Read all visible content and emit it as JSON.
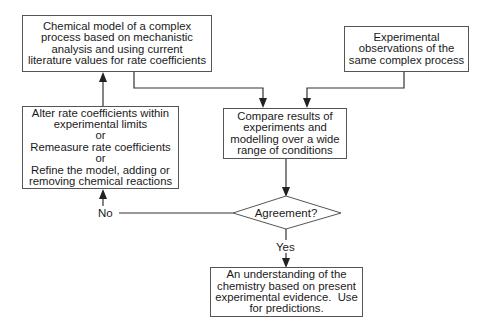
{
  "diagram": {
    "type": "flowchart",
    "nodes": {
      "model": {
        "lines": [
          "Chemical model of a complex",
          "process based on mechanistic",
          "analysis and using current",
          "literature values for rate coefficients"
        ]
      },
      "experiments": {
        "lines": [
          "Experimental",
          "observations of the",
          "same complex process"
        ]
      },
      "compare": {
        "lines": [
          "Compare results of",
          "experiments and",
          "modelling over a wide",
          "range of conditions"
        ]
      },
      "alter": {
        "lines": [
          "Alter rate coefficients within",
          "experimental limits",
          "or",
          "Remeasure rate coefficients",
          "or",
          "Refine the model, adding or",
          "removing chemical reactions"
        ]
      },
      "decision": {
        "label": "Agreement?"
      },
      "understanding": {
        "lines": [
          "An understanding of the",
          "chemistry based on present",
          "experimental evidence.  Use",
          "for predictions."
        ]
      }
    },
    "edges": {
      "no_label": "No",
      "yes_label": "Yes"
    },
    "colors": {
      "line": "#333333",
      "box_border": "#555555",
      "text": "#1a1a1a"
    }
  }
}
